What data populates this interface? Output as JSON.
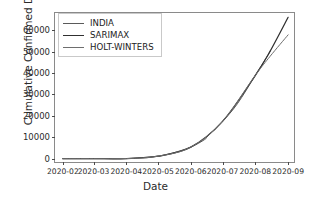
{
  "chart_data": {
    "type": "line",
    "title": "",
    "xlabel": "Date",
    "ylabel": "Cumulative Confirmed Deaths",
    "grid": false,
    "legend_position": "upper left",
    "xtick_labels": [
      "2020-02",
      "2020-03",
      "2020-04",
      "2020-05",
      "2020-06",
      "2020-07",
      "2020-08",
      "2020-09"
    ],
    "ytick_labels": [
      "0",
      "10000",
      "20000",
      "30000",
      "40000",
      "50000",
      "60000"
    ],
    "ylim": [
      -2500,
      68000
    ],
    "ytick_values": [
      0,
      10000,
      20000,
      30000,
      40000,
      50000,
      60000
    ],
    "x_range": [
      "2020-02-01",
      "2020-09-01"
    ],
    "series": [
      {
        "name": "INDIA",
        "color": "#5a5a5a",
        "x": [
          "2020-02-01",
          "2020-02-15",
          "2020-03-01",
          "2020-03-15",
          "2020-04-01",
          "2020-04-15",
          "2020-05-01",
          "2020-05-15",
          "2020-06-01",
          "2020-06-14",
          "2020-06-17",
          "2020-07-01",
          "2020-07-15",
          "2020-08-01",
          "2020-08-15"
        ],
        "values": [
          0,
          0,
          0,
          2,
          35,
          405,
          1150,
          2650,
          5400,
          8900,
          10500,
          17400,
          25600,
          38900,
          50000
        ]
      },
      {
        "name": "SARIMAX",
        "color": "#303030",
        "x": [
          "2020-02-01",
          "2020-03-01",
          "2020-04-01",
          "2020-05-01",
          "2020-06-01",
          "2020-07-01",
          "2020-08-01",
          "2020-08-15",
          "2020-09-01"
        ],
        "values": [
          0,
          0,
          35,
          1150,
          5400,
          17400,
          38900,
          50200,
          66000
        ]
      },
      {
        "name": "HOLT-WINTERS",
        "color": "#6e6e6e",
        "x": [
          "2020-02-01",
          "2020-03-01",
          "2020-04-01",
          "2020-05-01",
          "2020-06-01",
          "2020-07-01",
          "2020-08-01",
          "2020-08-15",
          "2020-09-01"
        ],
        "values": [
          0,
          0,
          35,
          1150,
          5400,
          17400,
          38900,
          47800,
          57800
        ]
      }
    ]
  },
  "legend": {
    "items": [
      {
        "label": "INDIA"
      },
      {
        "label": "SARIMAX"
      },
      {
        "label": "HOLT-WINTERS"
      }
    ]
  }
}
